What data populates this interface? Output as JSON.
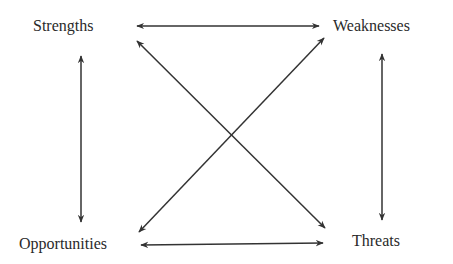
{
  "diagram": {
    "type": "SWOT relationship diagram",
    "nodes": [
      {
        "id": "strengths",
        "label": "Strengths"
      },
      {
        "id": "weaknesses",
        "label": "Weaknesses"
      },
      {
        "id": "opportunities",
        "label": "Opportunities"
      },
      {
        "id": "threats",
        "label": "Threats"
      }
    ],
    "edges": [
      {
        "from": "strengths",
        "to": "weaknesses",
        "style": "bidirectional"
      },
      {
        "from": "strengths",
        "to": "opportunities",
        "style": "bidirectional"
      },
      {
        "from": "weaknesses",
        "to": "threats",
        "style": "bidirectional"
      },
      {
        "from": "opportunities",
        "to": "threats",
        "style": "bidirectional"
      },
      {
        "from": "strengths",
        "to": "threats",
        "style": "bidirectional"
      },
      {
        "from": "weaknesses",
        "to": "opportunities",
        "style": "bidirectional"
      }
    ],
    "colors": {
      "line": "#333333",
      "text": "#2a2a2a",
      "background": "#ffffff"
    }
  }
}
